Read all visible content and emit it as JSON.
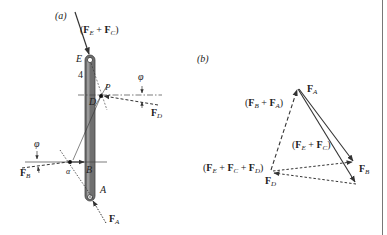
{
  "figure": {
    "panel_a": {
      "label": "(a)",
      "resultant_label": {
        "open": "(",
        "f1": "F",
        "s1": "E",
        "plus": " + ",
        "f2": "F",
        "s2": "C",
        "close": ")"
      },
      "point_E": "E",
      "slope_number": "4",
      "point_P": "P",
      "point_D": "D",
      "point_B": "B",
      "point_A": "A",
      "angle_top": "φ",
      "angle_bottom": "φ",
      "alpha_label": "α",
      "force_D": {
        "f": "F",
        "s": "D"
      },
      "force_B": {
        "f": "F",
        "s": "B"
      },
      "force_A": {
        "f": "F",
        "s": "A"
      }
    },
    "panel_b": {
      "label": "(b)",
      "vertex_FA": {
        "f": "F",
        "s": "A"
      },
      "vertex_FB": {
        "f": "F",
        "s": "B"
      },
      "vertex_FD": {
        "f": "F",
        "s": "D"
      },
      "sum_BA": {
        "open": "(",
        "f1": "F",
        "s1": "B",
        "plus": " + ",
        "f2": "F",
        "s2": "A",
        "close": ")"
      },
      "sum_EC": {
        "open": "(",
        "f1": "F",
        "s1": "E",
        "plus": " + ",
        "f2": "F",
        "s2": "C",
        "close": ")"
      },
      "sum_ECD": {
        "open": "(",
        "f1": "F",
        "s1": "E",
        "plus1": " + ",
        "f2": "F",
        "s2": "C",
        "plus2": " + ",
        "f3": "F",
        "s3": "D",
        "close": ")"
      }
    },
    "colors": {
      "line": "#333333",
      "rod": "#6f6f6f",
      "rod_highlight": "#9a9a9a",
      "border": "#777777"
    }
  }
}
